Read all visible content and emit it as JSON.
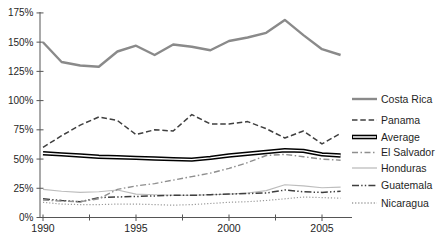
{
  "chart_data": {
    "type": "line",
    "title": "",
    "xlabel": "",
    "ylabel": "",
    "grid": false,
    "legend_position": "right",
    "ylim": [
      0,
      175
    ],
    "ytick_step": 25,
    "ytick_suffix": "%",
    "ytick_labels": [
      "0%",
      "25%",
      "50%",
      "75%",
      "100%",
      "125%",
      "150%",
      "175%"
    ],
    "xlim": [
      1990,
      2006
    ],
    "xtick_labels": [
      "1990",
      "1995",
      "2000",
      "2005"
    ],
    "xticks_major": [
      1990,
      1995,
      2000,
      2005
    ],
    "xticks_minor": [
      1992.5,
      1997.5,
      2002.5
    ],
    "x": [
      1990,
      1991,
      1992,
      1993,
      1994,
      1995,
      1996,
      1997,
      1998,
      1999,
      2000,
      2001,
      2002,
      2003,
      2004,
      2005,
      2006
    ],
    "series": [
      {
        "name": "Costa Rica",
        "style": "solid-thick",
        "color": "#8a8a8a",
        "values": [
          150,
          133,
          130,
          129,
          142,
          147,
          139,
          148,
          146,
          143,
          151,
          154,
          158,
          169,
          156,
          144,
          139
        ]
      },
      {
        "name": "Panama",
        "style": "dashed",
        "color": "#3f3f3f",
        "values": [
          60,
          70,
          79,
          86,
          83,
          71,
          75,
          74,
          88,
          80,
          80,
          82,
          76,
          68,
          74,
          63,
          72
        ]
      },
      {
        "name": "Average",
        "style": "double",
        "color": "#000000",
        "values": [
          55,
          54,
          53,
          52,
          51.5,
          51,
          50.5,
          50,
          49.5,
          51,
          53,
          54.5,
          56,
          57.5,
          57,
          54,
          53
        ]
      },
      {
        "name": "El Salvador",
        "style": "dash-dot",
        "color": "#8f8f8f",
        "values": [
          15,
          14,
          13.5,
          16,
          24,
          27,
          29,
          32,
          35,
          38,
          42,
          47,
          53,
          54,
          52,
          50,
          49
        ]
      },
      {
        "name": "Honduras",
        "style": "solid-thin",
        "color": "#bdbdbd",
        "values": [
          24,
          22.5,
          21.5,
          22,
          23.5,
          20,
          19.5,
          19,
          19,
          19.5,
          20,
          21,
          23,
          28,
          27,
          25.5,
          26
        ]
      },
      {
        "name": "Guatemala",
        "style": "dash-dot-dot",
        "color": "#3f3f3f",
        "values": [
          16,
          14.5,
          13.5,
          17,
          17.5,
          18,
          18.5,
          19,
          19,
          19.5,
          20,
          20.5,
          21,
          23.5,
          22,
          21.5,
          22.5
        ]
      },
      {
        "name": "Nicaragua",
        "style": "dotted",
        "color": "#9a9a9a",
        "values": [
          13,
          11.5,
          11,
          11,
          11.5,
          11.5,
          11,
          10.5,
          11,
          12,
          13,
          13.5,
          14.5,
          16,
          17.5,
          17,
          16.5
        ]
      }
    ]
  }
}
